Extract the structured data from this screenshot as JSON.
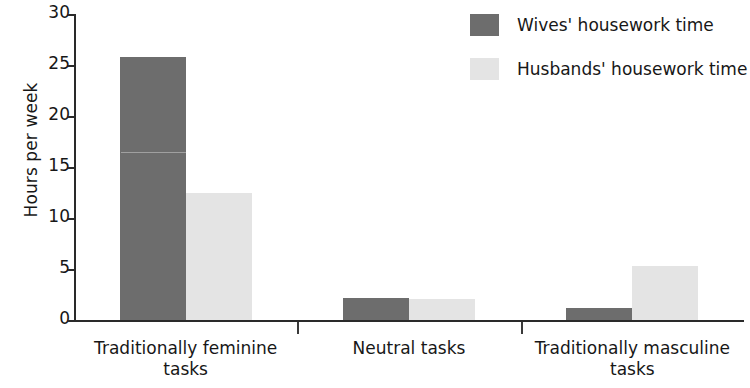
{
  "chart_data": {
    "type": "bar",
    "title": "",
    "subtitle": "",
    "xlabel": "",
    "ylabel": "Hours per week",
    "ylim": [
      0,
      30
    ],
    "yticks": [
      0,
      5,
      10,
      15,
      20,
      25,
      30
    ],
    "ytick_labels": [
      "0",
      "5",
      "10",
      "15",
      "20",
      "25",
      "30"
    ],
    "grid": false,
    "legend_position": "top-right",
    "categories": [
      "Traditionally feminine tasks",
      "Neutral tasks",
      "Traditionally masculine tasks"
    ],
    "category_lines": [
      [
        "Traditionally feminine",
        "tasks"
      ],
      [
        "Neutral tasks"
      ],
      [
        "Traditionally masculine",
        "tasks"
      ]
    ],
    "series": [
      {
        "name": "Wives' housework time",
        "color": "#6d6d6d",
        "values": [
          26.0,
          2.4,
          1.4
        ]
      },
      {
        "name": "Husbands' housework time",
        "color": "#e4e4e4",
        "values": [
          12.6,
          2.3,
          5.5
        ]
      }
    ]
  },
  "legend": {
    "items": [
      {
        "label": "Wives' housework time",
        "swatch": "dark"
      },
      {
        "label": "Husbands' housework time",
        "swatch": "light"
      }
    ]
  },
  "axes": {
    "y_title": "Hours per week"
  }
}
